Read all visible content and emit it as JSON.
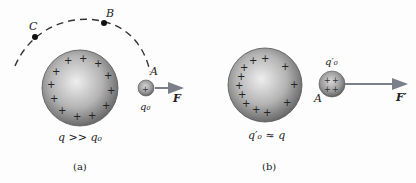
{
  "panel_a": {
    "caption": "(a)",
    "point_labels": {
      "A": "A",
      "B": "B",
      "C": "C"
    },
    "large_sphere_label": "q >> q₀",
    "small_sphere_label": "q₀",
    "force_label": "F",
    "large_sphere_charges": 13,
    "small_sphere_charges": 1
  },
  "panel_b": {
    "caption": "(b)",
    "point_labels": {
      "A": "A"
    },
    "large_sphere_label": "q′₀ ≈ q",
    "small_sphere_label": "q′₀",
    "force_label": "F′",
    "large_sphere_charges": 13,
    "small_sphere_charges": 4
  },
  "colors": {
    "sphere_light": "#e6e6e6",
    "sphere_dark": "#6b6b6b",
    "arrow": "#7a7f8a",
    "ink": "#222222"
  }
}
